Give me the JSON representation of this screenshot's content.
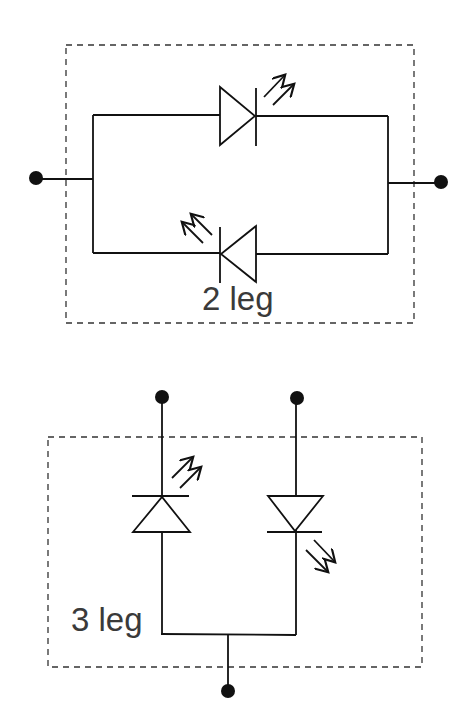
{
  "diagrams": [
    {
      "id": "two-leg",
      "label": "2 leg",
      "description": "Two LEDs in anti-parallel between two terminals"
    },
    {
      "id": "three-leg",
      "label": "3 leg",
      "description": "Two LEDs with a common terminal and two separate terminals"
    }
  ],
  "colors": {
    "line": "#111111",
    "label": "#3a3a3a",
    "background": "#ffffff"
  }
}
